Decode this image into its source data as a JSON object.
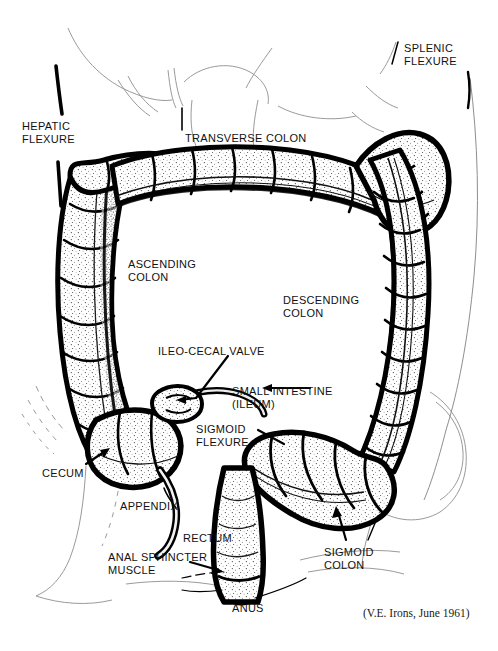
{
  "figure": {
    "type": "line-art-illustration",
    "width": 498,
    "height": 651,
    "background_color": "#ffffff",
    "ink_color": "#000000",
    "credit": "(V.E. Irons, June 1961)"
  },
  "labels": [
    {
      "id": "hepatic-flexure",
      "text": "HEPATIC\nFLEXURE",
      "x": 22,
      "y": 120,
      "align": "left"
    },
    {
      "id": "transverse-colon",
      "text": "TRANSVERSE COLON",
      "x": 185,
      "y": 132,
      "align": "left"
    },
    {
      "id": "splenic-flexure",
      "text": "SPLENIC\nFLEXURE",
      "x": 404,
      "y": 42,
      "align": "left"
    },
    {
      "id": "ascending-colon",
      "text": "ASCENDING\nCOLON",
      "x": 128,
      "y": 258,
      "align": "left"
    },
    {
      "id": "descending-colon",
      "text": "DESCENDING\nCOLON",
      "x": 283,
      "y": 294,
      "align": "left"
    },
    {
      "id": "ileo-cecal-valve",
      "text": "ILEO-CECAL VALVE",
      "x": 158,
      "y": 345,
      "align": "left"
    },
    {
      "id": "small-intestine-ileum",
      "text": "SMALL INTESTINE\n(ILEUM)",
      "x": 232,
      "y": 385,
      "align": "left"
    },
    {
      "id": "sigmoid-flexure",
      "text": "SIGMOID\nFLEXURE",
      "x": 196,
      "y": 423,
      "align": "left"
    },
    {
      "id": "cecum",
      "text": "CECUM",
      "x": 42,
      "y": 467,
      "align": "left"
    },
    {
      "id": "appendix",
      "text": "APPENDIX",
      "x": 120,
      "y": 500,
      "align": "left"
    },
    {
      "id": "rectum",
      "text": "RECTUM",
      "x": 183,
      "y": 532,
      "align": "left"
    },
    {
      "id": "anal-sphincter-muscle",
      "text": "ANAL SPHINCTER\nMUSCLE",
      "x": 108,
      "y": 551,
      "align": "left"
    },
    {
      "id": "sigmoid-colon",
      "text": "SIGMOID\nCOLON",
      "x": 324,
      "y": 546,
      "align": "left"
    },
    {
      "id": "anus",
      "text": "ANUS",
      "x": 232,
      "y": 602,
      "align": "left"
    }
  ],
  "credit_position": {
    "x": 363,
    "y": 607
  },
  "anatomy_parts": [
    "hepatic flexure",
    "transverse colon",
    "splenic flexure",
    "ascending colon",
    "descending colon",
    "ileo-cecal valve",
    "small intestine (ileum)",
    "sigmoid flexure",
    "cecum",
    "appendix",
    "rectum",
    "anal sphincter muscle",
    "sigmoid colon",
    "anus"
  ]
}
